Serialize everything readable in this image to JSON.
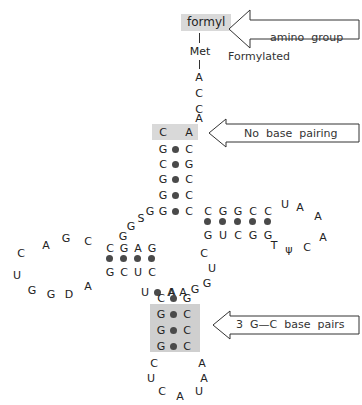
{
  "figure": {
    "type": "trna-cloverleaf-diagram"
  },
  "colors": {
    "highlight_light": "#d9d9d9",
    "highlight_dark": "#cfcfcf",
    "pair_dot": "#4a4a4a",
    "text": "#222222",
    "line": "#333333"
  },
  "labels": {
    "formyl": "formyl",
    "met": "Met"
  },
  "callouts": [
    {
      "id": "formylated-amino-group",
      "line1": "Formylated",
      "line2": "amino  group"
    },
    {
      "id": "no-base-pairing",
      "line1": "No  base  pairing",
      "line2": ""
    },
    {
      "id": "three-gc-base-pairs",
      "line1": "3  G—C  base  pairs",
      "line2": ""
    }
  ],
  "acceptor_arm": {
    "single_strand_3prime": [
      "A",
      "C",
      "C",
      "A"
    ],
    "unpaired_top": {
      "left": "C",
      "right": "A"
    },
    "pairs": [
      {
        "left": "G",
        "right": "C"
      },
      {
        "left": "C",
        "right": "G"
      },
      {
        "left": "G",
        "right": "C"
      },
      {
        "left": "G",
        "right": "C"
      },
      {
        "left": "G",
        "right": "C"
      }
    ]
  },
  "d_arm": {
    "pairs_top": [
      "C",
      "G",
      "A",
      "G"
    ],
    "pairs_bottom": [
      "G",
      "C",
      "U",
      "C"
    ],
    "loop": [
      "C",
      "G",
      "A",
      "C",
      "U",
      "G",
      "G",
      "D",
      "A"
    ]
  },
  "t_arm": {
    "pairs_top": [
      "C",
      "G",
      "G",
      "C",
      "C"
    ],
    "pairs_bottom": [
      "G",
      "U",
      "C",
      "G",
      "G"
    ],
    "loop": [
      "U",
      "A",
      "A",
      "A",
      "C",
      "ψ",
      "T"
    ]
  },
  "anticodon_arm": {
    "pairs": [
      {
        "left": "U",
        "right": "A"
      },
      {
        "left": "C",
        "right": "G"
      },
      {
        "left": "G",
        "right": "C"
      },
      {
        "left": "G",
        "right": "C"
      },
      {
        "left": "G",
        "right": "C"
      }
    ],
    "loop_left": [
      "C",
      "U",
      "C",
      "A"
    ],
    "loop_right": [
      "A",
      "A",
      "U"
    ]
  },
  "variable_loop": {
    "left_junction": [
      "G",
      "S",
      "G",
      "G"
    ],
    "right_junction": [
      "C",
      "U",
      "G",
      "G",
      "A",
      "A"
    ]
  }
}
